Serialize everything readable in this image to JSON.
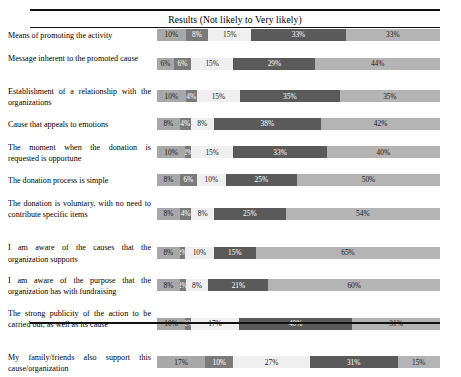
{
  "header": {
    "title": "Results (Not likely to Very likely)"
  },
  "chart_data": {
    "type": "bar",
    "title": "Results (Not likely to Very likely)",
    "subtype": "stacked-horizontal-100-percent",
    "xlabel": "",
    "ylabel": "",
    "xlim": [
      0,
      100
    ],
    "grid": false,
    "legend_position": "none",
    "value_suffix": "%",
    "series": [
      {
        "name": "Not likely",
        "values": [
          10,
          6,
          10,
          8,
          10,
          8,
          8,
          8,
          8,
          10,
          17
        ]
      },
      {
        "name": "Slightly likely",
        "values": [
          8,
          6,
          4,
          4,
          2,
          6,
          4,
          2,
          2,
          2,
          10
        ]
      },
      {
        "name": "Moderately likely",
        "values": [
          15,
          15,
          15,
          8,
          15,
          10,
          8,
          10,
          8,
          17,
          27
        ]
      },
      {
        "name": "Likely",
        "values": [
          33,
          29,
          35,
          38,
          33,
          25,
          25,
          15,
          21,
          40,
          31
        ]
      },
      {
        "name": "Very likely",
        "values": [
          33,
          44,
          35,
          42,
          40,
          50,
          54,
          65,
          60,
          31,
          15
        ]
      }
    ],
    "categories": [
      "Means of promoting the activity",
      "Message inherent to the promoted cause",
      "Establishment of a relationship with the organizations",
      "Cause that appeals to emotions",
      "The moment when the donation is requested is opportune",
      "The donation process is simple",
      "The donation is voluntary, with no need to contribute specific items",
      "I am aware of the causes that the organization supports",
      "I am aware of the purpose that the organization has with fundraising",
      "The strong publicity of the action to be carried out, as well as its cause",
      "My family/friends also support this cause/organization"
    ],
    "rows": [
      {
        "label": "Means of promoting the activity",
        "lines": 1,
        "values": [
          10,
          8,
          15,
          33,
          33
        ],
        "labels": [
          "10%",
          "8%",
          "15%",
          "33%",
          "33%"
        ]
      },
      {
        "label": "Message inherent to the promoted cause",
        "lines": 2,
        "values": [
          6,
          6,
          15,
          29,
          44
        ],
        "labels": [
          "6%",
          "6%",
          "15%",
          "29%",
          "44%"
        ]
      },
      {
        "label": "Establishment of a relationship with the organizations",
        "lines": 2,
        "values": [
          10,
          4,
          15,
          35,
          35
        ],
        "labels": [
          "10%",
          "4%",
          "15%",
          "35%",
          "35%"
        ]
      },
      {
        "label": "Cause that appeals to emotions",
        "lines": 1,
        "values": [
          8,
          4,
          8,
          38,
          42
        ],
        "labels": [
          "8%",
          "4%",
          "8%",
          "38%",
          "42%"
        ]
      },
      {
        "label": "The moment when the donation is requested is opportune",
        "lines": 2,
        "values": [
          10,
          2,
          15,
          33,
          40
        ],
        "labels": [
          "10%",
          "2%",
          "15%",
          "33%",
          "40%"
        ]
      },
      {
        "label": "The donation process is simple",
        "lines": 1,
        "values": [
          8,
          6,
          10,
          25,
          50
        ],
        "labels": [
          "8%",
          "6%",
          "10%",
          "25%",
          "50%"
        ]
      },
      {
        "label": "The donation is voluntary, with no need to contribute specific items",
        "lines": 3,
        "values": [
          8,
          4,
          8,
          25,
          54
        ],
        "labels": [
          "8%",
          "4%",
          "8%",
          "25%",
          "54%"
        ]
      },
      {
        "label": "I am aware of the causes that the organization supports",
        "lines": 2,
        "values": [
          8,
          2,
          10,
          15,
          65
        ],
        "labels": [
          "8%",
          "2%",
          "10%",
          "15%",
          "65%"
        ]
      },
      {
        "label": "I am aware of the purpose that the organization has with fundraising",
        "lines": 2,
        "values": [
          8,
          2,
          8,
          21,
          60
        ],
        "labels": [
          "8%",
          "2%",
          "8%",
          "21%",
          "60%"
        ]
      },
      {
        "label": "The strong publicity of the action to be carried out, as well as its cause",
        "lines": 3,
        "values": [
          10,
          2,
          17,
          40,
          31
        ],
        "labels": [
          "10%",
          "2%",
          "17%",
          "40%",
          "31%"
        ]
      },
      {
        "label": "My family/friends also support this cause/organization",
        "lines": 2,
        "values": [
          17,
          10,
          27,
          31,
          15
        ],
        "labels": [
          "17%",
          "10%",
          "27%",
          "31%",
          "15%"
        ]
      }
    ],
    "colors": {
      "seg_0": "#a8a8a8",
      "seg_1": "#7a7a7a",
      "seg_2": "#efefef",
      "seg_3": "#5a5a5a",
      "seg_4": "#b4b4b4"
    }
  }
}
